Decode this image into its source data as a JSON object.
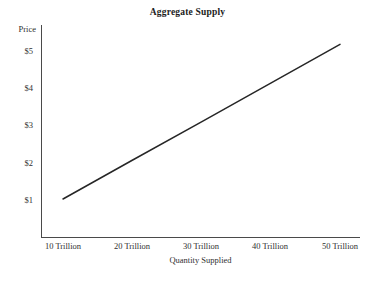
{
  "chart_data": {
    "type": "line",
    "title": "Aggregate Supply",
    "xlabel": "Quantity Supplied",
    "ylabel": "Price",
    "grid": false,
    "legend": "none",
    "xlim": [
      5,
      55
    ],
    "ylim": [
      0,
      5.7
    ],
    "x_tick_labels": [
      "10 Trillion",
      "20 Trillion",
      "30 Trillion",
      "40 Trillion",
      "50 Trillion"
    ],
    "x_tick_values": [
      10,
      20,
      30,
      40,
      50
    ],
    "y_tick_labels": [
      "$1",
      "$2",
      "$3",
      "$4",
      "$5"
    ],
    "y_tick_values": [
      1,
      2,
      3,
      4,
      5
    ],
    "series": [
      {
        "name": "Aggregate Supply",
        "color": "#262626",
        "x": [
          10,
          50
        ],
        "y": [
          1.0,
          5.15
        ],
        "points": [
          {
            "x": 10,
            "y": 1.0
          },
          {
            "x": 20,
            "y": 2.04
          },
          {
            "x": 30,
            "y": 3.07
          },
          {
            "x": 40,
            "y": 4.11
          },
          {
            "x": 50,
            "y": 5.15
          }
        ]
      }
    ]
  },
  "colors": {
    "line": "#262626",
    "axis": "#4a4a4a",
    "text": "#2f2f2f",
    "title": "#1c1c1c",
    "background": "#ffffff"
  }
}
